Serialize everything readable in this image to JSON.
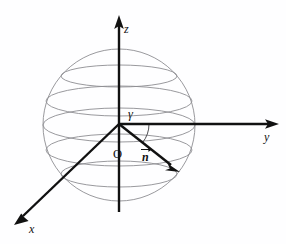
{
  "figure": {
    "background_color": "#fefeff",
    "axis_color": "#111111",
    "sphere_color": "#8d8d92"
  },
  "axes": [
    {
      "id": "z",
      "label": "z",
      "label_x": 124,
      "label_y": 33,
      "start_x": 119,
      "start_y": 212,
      "end_x": 119,
      "end_y": 18,
      "arrow": true
    },
    {
      "id": "y",
      "label": "y",
      "label_x": 264,
      "label_y": 141,
      "start_x": 119,
      "start_y": 124,
      "end_x": 277,
      "end_y": 124,
      "arrow": true
    },
    {
      "id": "x",
      "label": "x",
      "label_x": 29,
      "label_y": 233,
      "start_x": 119,
      "start_y": 124,
      "end_x": 16,
      "end_y": 223,
      "arrow": true
    }
  ],
  "origin": {
    "label": "O",
    "label_x": 113,
    "label_y": 158,
    "x": 119,
    "y": 124
  },
  "vector": {
    "label": "n",
    "label_x": 143,
    "label_y": 160,
    "overbar": true,
    "start_x": 119,
    "start_y": 124,
    "end_x": 177,
    "end_y": 170
  },
  "angle": {
    "label": "γ",
    "label_x": 128,
    "label_y": 118,
    "between": [
      "y",
      "n"
    ],
    "arc_radius": 30
  },
  "sphere": {
    "center_x": 119,
    "center_y": 125,
    "radius": 76,
    "latitude_circles": [
      {
        "cy": 76,
        "rx": 58,
        "ry": 11
      },
      {
        "cy": 101,
        "rx": 73,
        "ry": 15
      },
      {
        "cy": 125,
        "rx": 76,
        "ry": 17
      },
      {
        "cy": 150,
        "rx": 73,
        "ry": 16
      },
      {
        "cy": 174,
        "rx": 58,
        "ry": 13
      }
    ]
  }
}
